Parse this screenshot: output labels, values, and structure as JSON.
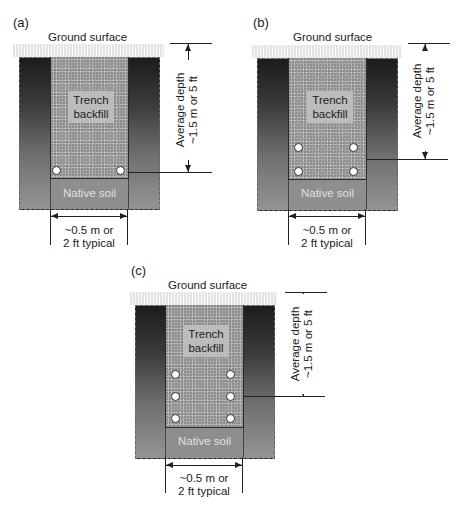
{
  "panels": {
    "a": {
      "label": "(a)",
      "ground_surface": "Ground surface",
      "trench_label_1": "Trench",
      "trench_label_2": "backfill",
      "native_soil": "Native soil",
      "depth_line_1": "Average depth",
      "depth_line_2": "~1.5 m or 5 ft",
      "width_line_1": "~0.5 m or",
      "width_line_2": "2 ft typical",
      "pipe_rows": 1
    },
    "b": {
      "label": "(b)",
      "ground_surface": "Ground surface",
      "trench_label_1": "Trench",
      "trench_label_2": "backfill",
      "native_soil": "Native soil",
      "depth_line_1": "Average depth",
      "depth_line_2": "~1.5 m or 5 ft",
      "width_line_1": "~0.5 m or",
      "width_line_2": "2 ft typical",
      "pipe_rows": 2
    },
    "c": {
      "label": "(c)",
      "ground_surface": "Ground surface",
      "trench_label_1": "Trench",
      "trench_label_2": "backfill",
      "native_soil": "Native soil",
      "depth_line_1": "Average depth",
      "depth_line_2": "~1.5 m or 5 ft",
      "width_line_1": "~0.5 m or",
      "width_line_2": "2 ft typical",
      "pipe_rows": 3
    }
  }
}
